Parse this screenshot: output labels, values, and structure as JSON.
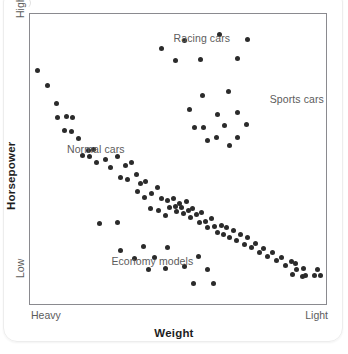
{
  "chart_data": {
    "type": "scatter",
    "title": "",
    "xlabel": "Weight",
    "ylabel": "Horsepower",
    "xticklabels": [
      "Heavy",
      "Light"
    ],
    "yticklabels": [
      "Low",
      "High"
    ],
    "xlim": [
      0,
      100
    ],
    "ylim": [
      0,
      100
    ],
    "grid": false,
    "legend": "none",
    "annotations": [
      {
        "text": "Racing cars",
        "x": 48.5,
        "y": 91.5
      },
      {
        "text": "Sports cars",
        "x": 81.0,
        "y": 70.5
      },
      {
        "text": "Normal cars",
        "x": 12.5,
        "y": 53.0
      },
      {
        "text": "Economy models",
        "x": 27.5,
        "y": 14.5
      }
    ],
    "series": [
      {
        "name": "All cars",
        "color": "#2b2b2b",
        "points": [
          [
            2.7,
            80.5
          ],
          [
            5.8,
            75.4
          ],
          [
            9.1,
            69.2
          ],
          [
            9.2,
            64.3
          ],
          [
            12.4,
            64.5
          ],
          [
            14.4,
            64.3
          ],
          [
            11.7,
            59.8
          ],
          [
            14.1,
            59.5
          ],
          [
            16.4,
            57.0
          ],
          [
            19.7,
            53.0
          ],
          [
            17.7,
            51.3
          ],
          [
            20.2,
            51.0
          ],
          [
            21.6,
            53.4
          ],
          [
            22.4,
            48.8
          ],
          [
            25.4,
            50.0
          ],
          [
            27.1,
            47.0
          ],
          [
            29.6,
            51.0
          ],
          [
            32.4,
            47.6
          ],
          [
            34.3,
            48.8
          ],
          [
            30.6,
            43.7
          ],
          [
            33.1,
            43.1
          ],
          [
            36.0,
            44.6
          ],
          [
            37.3,
            41.5
          ],
          [
            36.4,
            38.9
          ],
          [
            38.7,
            36.6
          ],
          [
            39.1,
            42.4
          ],
          [
            41.0,
            38.2
          ],
          [
            40.6,
            33.0
          ],
          [
            43.1,
            40.1
          ],
          [
            44.3,
            36.5
          ],
          [
            43.4,
            32.2
          ],
          [
            45.7,
            30.6
          ],
          [
            46.4,
            35.8
          ],
          [
            47.1,
            33.4
          ],
          [
            48.4,
            36.3
          ],
          [
            49.1,
            33.6
          ],
          [
            49.6,
            31.8
          ],
          [
            50.4,
            34.8
          ],
          [
            51.2,
            33.2
          ],
          [
            52.0,
            31.3
          ],
          [
            52.9,
            35.2
          ],
          [
            53.4,
            32.4
          ],
          [
            54.2,
            30.0
          ],
          [
            55.0,
            33.1
          ],
          [
            56.4,
            30.7
          ],
          [
            57.1,
            28.1
          ],
          [
            58.0,
            31.5
          ],
          [
            59.3,
            28.6
          ],
          [
            60.1,
            26.3
          ],
          [
            61.3,
            29.4
          ],
          [
            62.4,
            26.8
          ],
          [
            63.2,
            24.6
          ],
          [
            64.6,
            27.2
          ],
          [
            65.4,
            24.1
          ],
          [
            66.3,
            26.4
          ],
          [
            67.5,
            23.0
          ],
          [
            68.9,
            25.3
          ],
          [
            69.8,
            21.8
          ],
          [
            71.0,
            23.9
          ],
          [
            72.3,
            20.6
          ],
          [
            73.4,
            22.8
          ],
          [
            74.8,
            19.4
          ],
          [
            76.1,
            21.0
          ],
          [
            77.4,
            17.8
          ],
          [
            78.8,
            19.2
          ],
          [
            80.4,
            16.4
          ],
          [
            81.8,
            17.9
          ],
          [
            83.4,
            15.0
          ],
          [
            85.0,
            16.1
          ],
          [
            86.4,
            13.2
          ],
          [
            88.2,
            14.6
          ],
          [
            89.6,
            14.1
          ],
          [
            90.2,
            11.9
          ],
          [
            92.4,
            12.2
          ],
          [
            93.1,
            9.8
          ],
          [
            96.0,
            10.0
          ],
          [
            97.0,
            12.0
          ],
          [
            98.2,
            9.9
          ],
          [
            44.4,
            88.2
          ],
          [
            52.2,
            90.8
          ],
          [
            64.0,
            93.0
          ],
          [
            73.4,
            91.2
          ],
          [
            49.3,
            84.0
          ],
          [
            57.6,
            84.4
          ],
          [
            70.0,
            84.5
          ],
          [
            58.4,
            72.0
          ],
          [
            67.2,
            73.3
          ],
          [
            53.8,
            67.0
          ],
          [
            63.5,
            65.2
          ],
          [
            70.0,
            66.0
          ],
          [
            55.6,
            61.0
          ],
          [
            58.7,
            60.8
          ],
          [
            65.6,
            61.7
          ],
          [
            73.0,
            62.0
          ],
          [
            63.0,
            57.3
          ],
          [
            70.2,
            57.5
          ],
          [
            60.0,
            56.4
          ],
          [
            67.3,
            54.6
          ],
          [
            23.6,
            27.8
          ],
          [
            29.4,
            28.2
          ],
          [
            30.6,
            18.6
          ],
          [
            38.4,
            20.0
          ],
          [
            35.4,
            15.6
          ],
          [
            42.0,
            16.2
          ],
          [
            46.4,
            19.4
          ],
          [
            40.0,
            11.8
          ],
          [
            45.8,
            12.4
          ],
          [
            52.2,
            13.0
          ],
          [
            57.0,
            16.4
          ],
          [
            59.8,
            11.8
          ],
          [
            55.2,
            7.0
          ],
          [
            62.0,
            6.9
          ],
          [
            88.8,
            10.2
          ],
          [
            92.0,
            9.4
          ]
        ]
      }
    ]
  }
}
